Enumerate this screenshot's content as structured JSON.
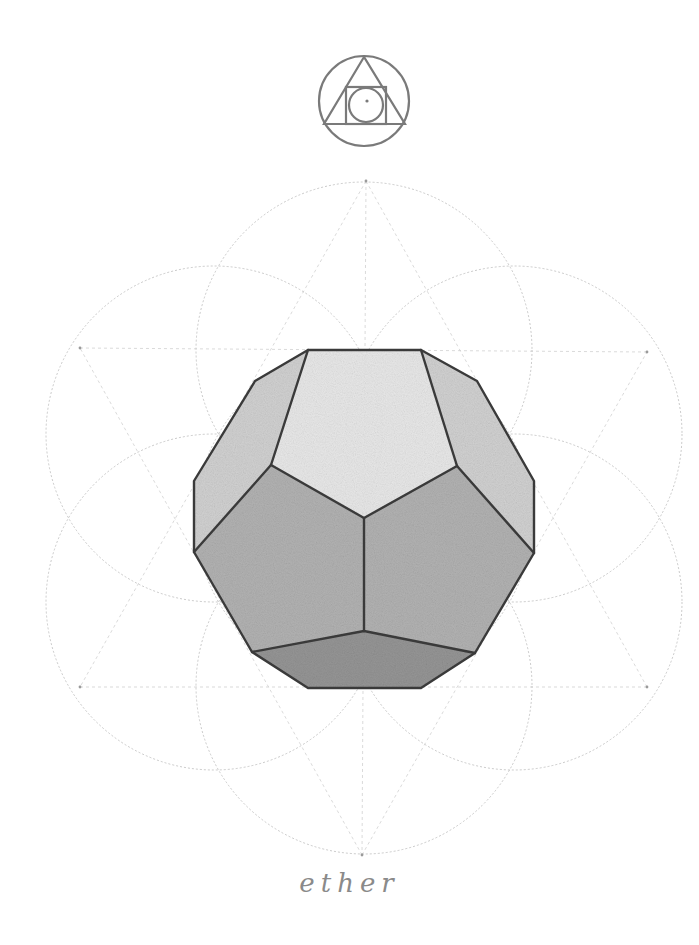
{
  "artwork": {
    "subject": "Dodecahedron over Seed of Life construction",
    "caption": "ether",
    "background_color": "#ffffff",
    "colors": {
      "edge": "#3a3a3a",
      "construction": "#b8b8b8",
      "symbol": "#7a7a7a",
      "face_top": "#e6e6e6",
      "face_sides": "#cdcdcd",
      "face_front": "#ababab",
      "face_bottom": "#8c8c8c"
    }
  },
  "symbol": {
    "name": "philosophers-stone-glyph",
    "outer_circle": {
      "cx": 364,
      "cy": 101,
      "r": 45
    },
    "triangle": [
      [
        364,
        57
      ],
      [
        324,
        124
      ],
      [
        405,
        124
      ]
    ],
    "square": {
      "x": 346,
      "y": 87,
      "w": 40,
      "h": 37
    },
    "inner_circle": {
      "cx": 366,
      "cy": 105,
      "r": 17
    },
    "dot": {
      "cx": 367,
      "cy": 101,
      "r": 1.6
    }
  },
  "seed_of_life": {
    "radius": 168,
    "circles": [
      {
        "name": "center",
        "cx": 364,
        "cy": 518
      },
      {
        "name": "top",
        "cx": 364,
        "cy": 350
      },
      {
        "name": "bottom",
        "cx": 364,
        "cy": 686
      },
      {
        "name": "upper-left",
        "cx": 214,
        "cy": 434
      },
      {
        "name": "upper-right",
        "cx": 514,
        "cy": 434
      },
      {
        "name": "lower-left",
        "cx": 214,
        "cy": 602
      },
      {
        "name": "lower-right",
        "cx": 514,
        "cy": 602
      }
    ],
    "star_points": {
      "top": [
        366,
        181
      ],
      "bottom": [
        362,
        855
      ],
      "upper_left": [
        80,
        348
      ],
      "upper_right": [
        647,
        352
      ],
      "lower_left": [
        80,
        687
      ],
      "lower_right": [
        647,
        687
      ]
    }
  },
  "dodecahedron": {
    "outline": [
      [
        308,
        350
      ],
      [
        421,
        350
      ],
      [
        477,
        381
      ],
      [
        534,
        481
      ],
      [
        534,
        553
      ],
      [
        475,
        653
      ],
      [
        421,
        688
      ],
      [
        308,
        688
      ],
      [
        252,
        652
      ],
      [
        194,
        552
      ],
      [
        194,
        481
      ],
      [
        255,
        381
      ]
    ],
    "faces": {
      "top": [
        [
          308,
          350
        ],
        [
          421,
          350
        ],
        [
          457,
          466
        ],
        [
          364,
          518
        ],
        [
          271,
          465
        ]
      ],
      "upper_left": [
        [
          308,
          350
        ],
        [
          271,
          465
        ],
        [
          194,
          552
        ],
        [
          194,
          481
        ],
        [
          255,
          381
        ]
      ],
      "upper_right": [
        [
          421,
          350
        ],
        [
          477,
          381
        ],
        [
          534,
          481
        ],
        [
          534,
          553
        ],
        [
          457,
          466
        ]
      ],
      "front_left": [
        [
          271,
          465
        ],
        [
          364,
          518
        ],
        [
          364,
          631
        ],
        [
          252,
          652
        ],
        [
          194,
          552
        ]
      ],
      "front_right": [
        [
          457,
          466
        ],
        [
          534,
          553
        ],
        [
          475,
          653
        ],
        [
          364,
          631
        ],
        [
          364,
          518
        ]
      ],
      "bottom": [
        [
          252,
          652
        ],
        [
          364,
          631
        ],
        [
          475,
          653
        ],
        [
          421,
          688
        ],
        [
          308,
          688
        ]
      ]
    },
    "inner_edges": [
      [
        [
          308,
          350
        ],
        [
          271,
          465
        ]
      ],
      [
        [
          271,
          465
        ],
        [
          364,
          518
        ]
      ],
      [
        [
          364,
          518
        ],
        [
          457,
          466
        ]
      ],
      [
        [
          457,
          466
        ],
        [
          421,
          350
        ]
      ],
      [
        [
          271,
          465
        ],
        [
          194,
          552
        ]
      ],
      [
        [
          457,
          466
        ],
        [
          534,
          553
        ]
      ],
      [
        [
          364,
          518
        ],
        [
          364,
          631
        ]
      ],
      [
        [
          364,
          631
        ],
        [
          252,
          652
        ]
      ],
      [
        [
          364,
          631
        ],
        [
          475,
          653
        ]
      ]
    ]
  }
}
